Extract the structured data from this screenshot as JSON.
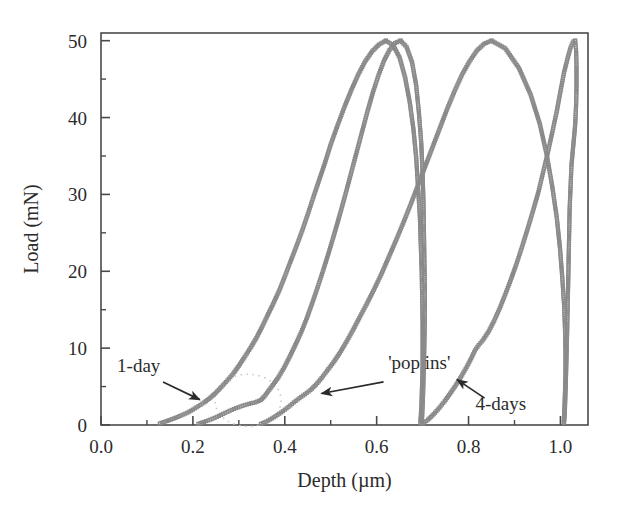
{
  "chart_data": {
    "type": "line",
    "title": "",
    "xlabel": "Depth (µm)",
    "ylabel": "Load (mN)",
    "xlim": [
      0.0,
      1.06
    ],
    "ylim": [
      0,
      51
    ],
    "xticks": [
      0.0,
      0.2,
      0.4,
      0.6,
      0.8,
      1.0
    ],
    "xticklabels": [
      "0.0",
      "0.2",
      "0.4",
      "0.6",
      "0.8",
      "1.0"
    ],
    "yticks": [
      0,
      10,
      20,
      30,
      40,
      50
    ],
    "yticklabels": [
      "0",
      "10",
      "20",
      "30",
      "40",
      "50"
    ],
    "x_minor_ticks": [
      0.1,
      0.3,
      0.5,
      0.7,
      0.9
    ],
    "y_minor_ticks": [
      5,
      15,
      25,
      35,
      45
    ],
    "grid": false,
    "legend": null,
    "marker": "open-square",
    "series_color": "#8a8a8a",
    "axis_color": "#4a4a4a",
    "text_color": "#2b2b2b",
    "series": [
      {
        "name": "1-day loading (curve 1)",
        "role": "loading",
        "points": [
          [
            0.128,
            0.2
          ],
          [
            0.14,
            0.45
          ],
          [
            0.152,
            0.7
          ],
          [
            0.163,
            0.95
          ],
          [
            0.175,
            1.25
          ],
          [
            0.188,
            1.6
          ],
          [
            0.2,
            2.0
          ],
          [
            0.212,
            2.45
          ],
          [
            0.225,
            2.95
          ],
          [
            0.238,
            3.55
          ],
          [
            0.25,
            4.2
          ],
          [
            0.262,
            4.95
          ],
          [
            0.275,
            5.8
          ],
          [
            0.288,
            6.7
          ],
          [
            0.3,
            7.7
          ],
          [
            0.312,
            8.8
          ],
          [
            0.325,
            10.0
          ],
          [
            0.338,
            11.3
          ],
          [
            0.35,
            12.7
          ],
          [
            0.362,
            14.2
          ],
          [
            0.375,
            15.8
          ],
          [
            0.388,
            17.5
          ],
          [
            0.4,
            19.3
          ],
          [
            0.412,
            21.2
          ],
          [
            0.425,
            23.2
          ],
          [
            0.438,
            25.3
          ],
          [
            0.45,
            27.4
          ],
          [
            0.462,
            29.6
          ],
          [
            0.475,
            31.9
          ],
          [
            0.488,
            34.2
          ],
          [
            0.5,
            36.5
          ],
          [
            0.515,
            39.0
          ],
          [
            0.53,
            41.4
          ],
          [
            0.545,
            43.6
          ],
          [
            0.56,
            45.6
          ],
          [
            0.575,
            47.3
          ],
          [
            0.59,
            48.6
          ],
          [
            0.605,
            49.5
          ],
          [
            0.62,
            50.0
          ]
        ]
      },
      {
        "name": "1-day unloading (curve 1)",
        "role": "unloading",
        "points": [
          [
            0.62,
            50.0
          ],
          [
            0.636,
            49.4
          ],
          [
            0.65,
            47.8
          ],
          [
            0.662,
            45.2
          ],
          [
            0.672,
            42.0
          ],
          [
            0.68,
            38.5
          ],
          [
            0.686,
            34.8
          ],
          [
            0.69,
            31.0
          ],
          [
            0.694,
            27.2
          ],
          [
            0.696,
            23.5
          ],
          [
            0.698,
            20.0
          ],
          [
            0.699,
            16.6
          ],
          [
            0.7,
            13.4
          ],
          [
            0.7,
            10.5
          ],
          [
            0.7,
            7.9
          ],
          [
            0.699,
            5.6
          ],
          [
            0.698,
            3.7
          ],
          [
            0.697,
            2.2
          ],
          [
            0.696,
            1.1
          ],
          [
            0.695,
            0.3
          ]
        ]
      },
      {
        "name": "1-day loading (curve 2)",
        "role": "loading",
        "points": [
          [
            0.212,
            0.15
          ],
          [
            0.224,
            0.4
          ],
          [
            0.238,
            0.7
          ],
          [
            0.252,
            1.05
          ],
          [
            0.266,
            1.45
          ],
          [
            0.28,
            1.85
          ],
          [
            0.294,
            2.2
          ],
          [
            0.308,
            2.5
          ],
          [
            0.322,
            2.75
          ],
          [
            0.336,
            2.95
          ],
          [
            0.348,
            3.25
          ],
          [
            0.356,
            3.75
          ],
          [
            0.364,
            4.4
          ],
          [
            0.374,
            5.2
          ],
          [
            0.386,
            6.2
          ],
          [
            0.398,
            7.4
          ],
          [
            0.41,
            8.8
          ],
          [
            0.423,
            10.4
          ],
          [
            0.436,
            12.1
          ],
          [
            0.448,
            13.9
          ],
          [
            0.46,
            15.9
          ],
          [
            0.472,
            18.0
          ],
          [
            0.484,
            20.2
          ],
          [
            0.496,
            22.5
          ],
          [
            0.508,
            24.9
          ],
          [
            0.52,
            27.4
          ],
          [
            0.532,
            30.0
          ],
          [
            0.544,
            32.7
          ],
          [
            0.556,
            35.4
          ],
          [
            0.568,
            38.1
          ],
          [
            0.58,
            40.8
          ],
          [
            0.592,
            43.3
          ],
          [
            0.604,
            45.5
          ],
          [
            0.616,
            47.4
          ],
          [
            0.628,
            48.8
          ],
          [
            0.64,
            49.7
          ],
          [
            0.652,
            50.0
          ]
        ]
      },
      {
        "name": "1-day unloading (curve 2)",
        "role": "unloading",
        "points": [
          [
            0.652,
            50.0
          ],
          [
            0.665,
            49.2
          ],
          [
            0.677,
            47.2
          ],
          [
            0.686,
            44.2
          ],
          [
            0.692,
            40.6
          ],
          [
            0.697,
            36.7
          ],
          [
            0.7,
            32.7
          ],
          [
            0.702,
            28.7
          ],
          [
            0.703,
            24.8
          ],
          [
            0.704,
            21.0
          ],
          [
            0.705,
            17.4
          ],
          [
            0.705,
            14.1
          ],
          [
            0.704,
            11.0
          ],
          [
            0.703,
            8.3
          ],
          [
            0.702,
            5.9
          ],
          [
            0.701,
            3.9
          ],
          [
            0.7,
            2.3
          ],
          [
            0.699,
            1.1
          ],
          [
            0.698,
            0.3
          ]
        ]
      },
      {
        "name": "4-days loading (curve 3)",
        "role": "loading",
        "points": [
          [
            0.348,
            0.15
          ],
          [
            0.36,
            0.45
          ],
          [
            0.372,
            0.85
          ],
          [
            0.384,
            1.3
          ],
          [
            0.396,
            1.8
          ],
          [
            0.408,
            2.35
          ],
          [
            0.42,
            2.95
          ],
          [
            0.432,
            3.5
          ],
          [
            0.444,
            4.0
          ],
          [
            0.456,
            4.55
          ],
          [
            0.468,
            5.25
          ],
          [
            0.48,
            6.1
          ],
          [
            0.492,
            7.05
          ],
          [
            0.506,
            8.15
          ],
          [
            0.52,
            9.4
          ],
          [
            0.534,
            10.8
          ],
          [
            0.548,
            12.3
          ],
          [
            0.562,
            13.9
          ],
          [
            0.578,
            15.7
          ],
          [
            0.594,
            17.6
          ],
          [
            0.61,
            19.6
          ],
          [
            0.626,
            21.8
          ],
          [
            0.642,
            24.0
          ],
          [
            0.658,
            26.3
          ],
          [
            0.674,
            28.7
          ],
          [
            0.69,
            31.2
          ],
          [
            0.706,
            33.7
          ],
          [
            0.722,
            36.2
          ],
          [
            0.738,
            38.7
          ],
          [
            0.754,
            41.2
          ],
          [
            0.77,
            43.5
          ],
          [
            0.786,
            45.6
          ],
          [
            0.802,
            47.3
          ],
          [
            0.818,
            48.7
          ],
          [
            0.834,
            49.6
          ],
          [
            0.85,
            50.0
          ]
        ]
      },
      {
        "name": "4-days unloading (curve 3)",
        "role": "unloading",
        "points": [
          [
            0.85,
            50.0
          ],
          [
            0.88,
            49.0
          ],
          [
            0.91,
            46.4
          ],
          [
            0.935,
            43.0
          ],
          [
            0.955,
            39.2
          ],
          [
            0.97,
            35.2
          ],
          [
            0.982,
            31.1
          ],
          [
            0.992,
            27.0
          ],
          [
            0.999,
            23.0
          ],
          [
            1.004,
            19.2
          ],
          [
            1.008,
            15.6
          ],
          [
            1.01,
            12.3
          ],
          [
            1.011,
            9.3
          ],
          [
            1.011,
            6.7
          ],
          [
            1.01,
            4.5
          ],
          [
            1.009,
            2.7
          ],
          [
            1.008,
            1.3
          ],
          [
            1.007,
            0.4
          ]
        ]
      },
      {
        "name": "4-days loading (curve 4)",
        "role": "loading",
        "points": [
          [
            0.7,
            0.15
          ],
          [
            0.712,
            0.7
          ],
          [
            0.724,
            1.4
          ],
          [
            0.736,
            2.2
          ],
          [
            0.748,
            3.1
          ],
          [
            0.76,
            4.1
          ],
          [
            0.772,
            5.15
          ],
          [
            0.784,
            6.3
          ],
          [
            0.796,
            7.55
          ],
          [
            0.806,
            8.7
          ],
          [
            0.814,
            9.7
          ],
          [
            0.822,
            10.4
          ],
          [
            0.832,
            11.1
          ],
          [
            0.844,
            12.2
          ],
          [
            0.856,
            13.6
          ],
          [
            0.868,
            15.2
          ],
          [
            0.88,
            17.0
          ],
          [
            0.892,
            18.9
          ],
          [
            0.904,
            20.9
          ],
          [
            0.916,
            23.1
          ],
          [
            0.928,
            25.4
          ],
          [
            0.94,
            27.8
          ],
          [
            0.952,
            30.3
          ],
          [
            0.962,
            32.8
          ],
          [
            0.972,
            35.3
          ],
          [
            0.982,
            38.0
          ],
          [
            0.992,
            40.8
          ],
          [
            1.0,
            43.4
          ],
          [
            1.008,
            45.9
          ],
          [
            1.016,
            47.8
          ],
          [
            1.022,
            49.1
          ],
          [
            1.028,
            49.9
          ],
          [
            1.032,
            50.0
          ]
        ]
      },
      {
        "name": "4-days unloading (curve 4)",
        "role": "unloading",
        "points": [
          [
            1.032,
            50.0
          ],
          [
            1.034,
            48.8
          ],
          [
            1.035,
            46.6
          ],
          [
            1.035,
            44.0
          ],
          [
            1.034,
            41.5
          ],
          [
            1.032,
            39.0
          ],
          [
            1.028,
            36.4
          ],
          [
            1.024,
            33.8
          ],
          [
            1.022,
            31.0
          ],
          [
            1.02,
            28.0
          ],
          [
            1.019,
            25.0
          ],
          [
            1.018,
            22.0
          ],
          [
            1.017,
            19.0
          ],
          [
            1.016,
            16.1
          ],
          [
            1.015,
            13.3
          ],
          [
            1.014,
            10.7
          ],
          [
            1.013,
            8.3
          ],
          [
            1.012,
            6.1
          ],
          [
            1.011,
            4.1
          ],
          [
            1.01,
            2.4
          ],
          [
            1.009,
            1.1
          ],
          [
            1.008,
            0.3
          ]
        ]
      }
    ],
    "annotations": [
      {
        "name": "1-day",
        "label": "1-day",
        "label_x": 0.035,
        "label_y": 6.9,
        "arrow_from": [
          0.135,
          5.6
        ],
        "arrow_to": [
          0.215,
          3.3
        ]
      },
      {
        "name": "pop-ins",
        "label": "'pop ins'",
        "label_x": 0.625,
        "label_y": 7.3,
        "arrow_from": [
          0.615,
          5.6
        ],
        "arrow_to": [
          0.48,
          4.1
        ]
      },
      {
        "name": "4-days",
        "label": "4-days",
        "label_x": 0.815,
        "label_y": 1.9,
        "arrow_from": [
          0.835,
          3.5
        ],
        "arrow_to": [
          0.775,
          5.9
        ]
      }
    ],
    "highlight_ellipse": {
      "name": "pop-ins-region",
      "center_x": 0.32,
      "center_y": 3.2,
      "radius_x": 0.072,
      "radius_y": 3.4,
      "style": "dotted",
      "color": "#c9c9c9"
    }
  }
}
